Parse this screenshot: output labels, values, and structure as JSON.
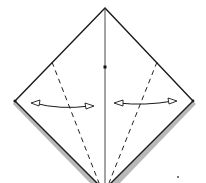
{
  "diagram": {
    "type": "origami-fold-step",
    "colors": {
      "paper": "#ffffff",
      "line": "#1a1a1a",
      "shadow": "#9a9a9a"
    },
    "elements": {
      "outline": "diamond",
      "center_crease": "vertical solid line",
      "center_mark": "dot",
      "left_valley_fold": "dashed line",
      "right_valley_fold": "dashed line",
      "left_arrow": "curved two-way arrow",
      "right_arrow": "curved two-way arrow"
    }
  }
}
